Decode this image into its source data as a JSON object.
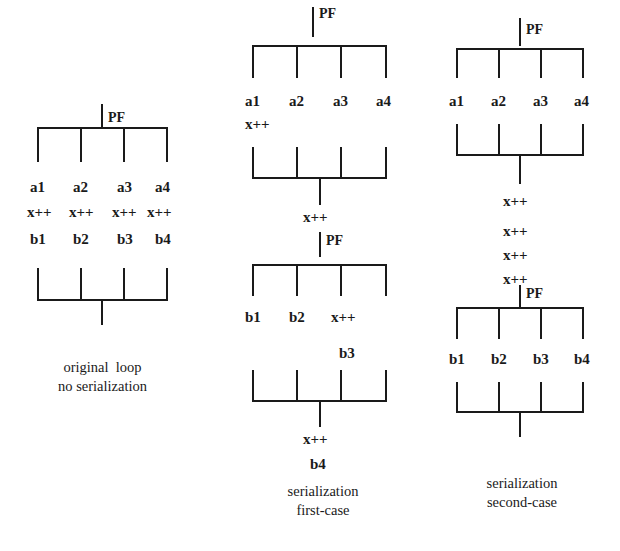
{
  "figure": {
    "ink_color": "#1a1a1a",
    "background": "#ffffff"
  },
  "columns": [
    {
      "id": "original",
      "caption_line1": "original  loop",
      "caption_line2": "no serialization",
      "fork_label": "PF",
      "rows": [
        {
          "name": "a-row",
          "cells": [
            "a1",
            "a2",
            "a3",
            "a4"
          ]
        },
        {
          "name": "x-row",
          "cells": [
            "x++",
            "x++",
            "x++",
            "x++"
          ]
        },
        {
          "name": "b-row",
          "cells": [
            "b1",
            "b2",
            "b3",
            "b4"
          ]
        }
      ]
    },
    {
      "id": "first-case",
      "caption_line1": "serialization",
      "caption_line2": "first-case",
      "fork_label_top": "PF",
      "fork_label_mid": "PF",
      "a_row": [
        "a1",
        "a2",
        "a3",
        "a4"
      ],
      "x_after_a": "x++",
      "join1_label": "x++",
      "b_row": [
        "b1",
        "b2",
        "x++"
      ],
      "b3_label": "b3",
      "join2_label": "x++",
      "b4_label": "b4"
    },
    {
      "id": "second-case",
      "caption_line1": "serialization",
      "caption_line2": "second-case",
      "fork_label_top": "PF",
      "fork_label_mid": "PF",
      "a_row": [
        "a1",
        "a2",
        "a3",
        "a4"
      ],
      "serial_x": [
        "x++",
        "x++",
        "x++",
        "x++"
      ],
      "b_row": [
        "b1",
        "b2",
        "b3",
        "b4"
      ]
    }
  ]
}
